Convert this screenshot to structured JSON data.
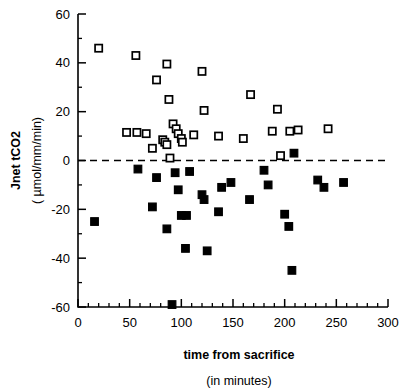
{
  "chart_data": {
    "type": "scatter",
    "title": "",
    "xlabel": "time from sacrifice",
    "xlabel_sub": "(in minutes)",
    "ylabel": "Jnet tCO2",
    "ylabel_sub": "( µmol/mm/min)",
    "xlim": [
      0,
      300
    ],
    "ylim": [
      -60,
      60
    ],
    "xticks": [
      0,
      50,
      100,
      150,
      200,
      250,
      300
    ],
    "xticklabels": [
      "0",
      "50",
      "100",
      "150",
      "200",
      "250",
      "300"
    ],
    "xminor_step": 10,
    "yticks": [
      -60,
      -40,
      -20,
      0,
      20,
      40,
      60
    ],
    "yticklabels": [
      "-60",
      "-40",
      "-20",
      "0",
      "20",
      "40",
      "60"
    ],
    "yminor_step": 10,
    "grid": false,
    "legend": "none",
    "annotations": [
      {
        "name": "zero-reference-line",
        "type": "hline",
        "y": 0,
        "style": "dashed"
      }
    ],
    "series": [
      {
        "name": "open-squares",
        "marker": "open-square",
        "points": [
          [
            20,
            46
          ],
          [
            56,
            43
          ],
          [
            76,
            33
          ],
          [
            86,
            39.5
          ],
          [
            120,
            36.5
          ],
          [
            47,
            11.5
          ],
          [
            57,
            11.5
          ],
          [
            66,
            11
          ],
          [
            72,
            5
          ],
          [
            82,
            8.5
          ],
          [
            84,
            7.5
          ],
          [
            86,
            6.5
          ],
          [
            88,
            25
          ],
          [
            92,
            15
          ],
          [
            95,
            13
          ],
          [
            97,
            11
          ],
          [
            100,
            9
          ],
          [
            101,
            7.5
          ],
          [
            112,
            10.5
          ],
          [
            122,
            20.5
          ],
          [
            136,
            10
          ],
          [
            89,
            1
          ],
          [
            167,
            27
          ],
          [
            193,
            21
          ],
          [
            213,
            12.5
          ],
          [
            242,
            13
          ],
          [
            188,
            12
          ],
          [
            205,
            12
          ],
          [
            160,
            9
          ],
          [
            196,
            2
          ]
        ]
      },
      {
        "name": "filled-squares",
        "marker": "filled-square",
        "points": [
          [
            16,
            -25
          ],
          [
            58,
            -3.5
          ],
          [
            76,
            -7
          ],
          [
            72,
            -19
          ],
          [
            86,
            -28
          ],
          [
            94,
            -5
          ],
          [
            97,
            -12
          ],
          [
            100,
            -22.5
          ],
          [
            105,
            -22.5
          ],
          [
            91,
            -59
          ],
          [
            104,
            -36
          ],
          [
            108,
            -4.5
          ],
          [
            120,
            -14
          ],
          [
            122,
            -16
          ],
          [
            125,
            -37
          ],
          [
            136,
            -21
          ],
          [
            139,
            -11
          ],
          [
            148,
            -9
          ],
          [
            166,
            -16
          ],
          [
            180,
            -4
          ],
          [
            184,
            -10
          ],
          [
            200,
            -22
          ],
          [
            204,
            -27
          ],
          [
            207,
            -45
          ],
          [
            209,
            3
          ],
          [
            232,
            -8
          ],
          [
            238,
            -11
          ],
          [
            257,
            -9
          ]
        ]
      }
    ]
  }
}
